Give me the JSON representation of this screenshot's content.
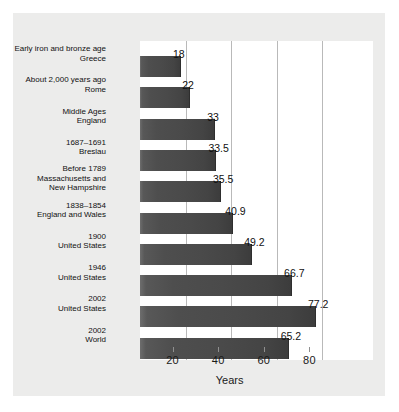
{
  "chart_data": {
    "type": "bar",
    "orientation": "horizontal",
    "title": "",
    "xlabel": "Years",
    "ylabel": "",
    "xlim": [
      0,
      90
    ],
    "xticks": [
      20,
      40,
      60,
      80
    ],
    "xticklabels": [
      "20",
      "40",
      "60",
      "80"
    ],
    "grid": "vertical",
    "legend": "none",
    "categories": [
      "Early iron and bronze age\nGreece",
      "About 2,000 years ago\nRome",
      "Middle Ages\nEngland",
      "1687–1691\nBreslau",
      "Before 1789\nMassachusetts and\nNew Hampshire",
      "1838–1854\nEngland and Wales",
      "1900\nUnited States",
      "1946\nUnited States",
      "2002\nUnited States",
      "2002\nWorld"
    ],
    "values": [
      18,
      22,
      33,
      33.5,
      35.5,
      40.9,
      49.2,
      66.7,
      77.2,
      65.2
    ],
    "value_labels": [
      "18",
      "22",
      "33",
      "33.5",
      "35.5",
      "40.9",
      "49.2",
      "66.7",
      "77.2",
      "65.2"
    ],
    "colors": {
      "bar": "#4a4a4a",
      "panel": "#ececeb",
      "plot": "#ffffff",
      "gridline": "#b9b9b9",
      "text": "#111111"
    }
  }
}
